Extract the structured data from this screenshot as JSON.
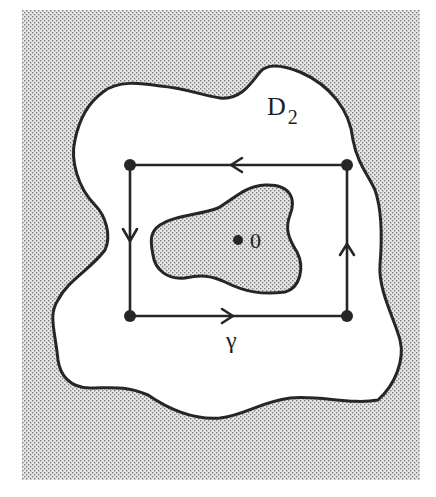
{
  "figure": {
    "labels": {
      "domain": "D",
      "domain_subscript": "2",
      "origin": "0",
      "contour": "γ"
    },
    "colors": {
      "stroke": "#262626",
      "background": "#ffffff",
      "shade_dot": "#8a8a8a",
      "shade_base": "#e4e4e4"
    },
    "contour_vertices": [
      [
        130,
        165
      ],
      [
        347,
        165
      ],
      [
        347,
        316
      ],
      [
        130,
        316
      ]
    ],
    "orientation": "counterclockwise"
  }
}
